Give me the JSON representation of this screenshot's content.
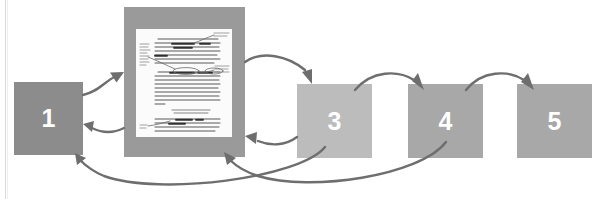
{
  "diagram": {
    "type": "process-flow-with-feedback-loops",
    "background_color": "#ffffff",
    "arrow_color": "#6e6e6e",
    "stages": [
      {
        "id": "stage-1",
        "label": "1",
        "kind": "box",
        "color": "#8c8c8c",
        "label_color": "#ffffff",
        "x": 14,
        "y": 82,
        "width": 69,
        "height": 73
      },
      {
        "id": "stage-2",
        "label": "",
        "kind": "document",
        "color": "#9a9a9a",
        "page_color": "#fbfbfb",
        "x": 124,
        "y": 7,
        "width": 121,
        "height": 150
      },
      {
        "id": "stage-3",
        "label": "3",
        "kind": "box",
        "color": "#bcbcbc",
        "label_color": "#ffffff",
        "x": 297,
        "y": 84,
        "width": 75,
        "height": 74
      },
      {
        "id": "stage-4",
        "label": "4",
        "kind": "box",
        "color": "#a8a8a8",
        "label_color": "#ffffff",
        "x": 408,
        "y": 84,
        "width": 75,
        "height": 74
      },
      {
        "id": "stage-5",
        "label": "5",
        "kind": "box",
        "color": "#a8a8a8",
        "label_color": "#ffffff",
        "x": 517,
        "y": 84,
        "width": 75,
        "height": 74
      }
    ],
    "connections": [
      {
        "id": "conn-1-to-2",
        "from": "stage-1",
        "to": "stage-2",
        "style": "curved-arrow",
        "direction": "forward"
      },
      {
        "id": "conn-2-to-1",
        "from": "stage-2",
        "to": "stage-1",
        "style": "curved-arrow",
        "direction": "feedback"
      },
      {
        "id": "conn-2-to-3",
        "from": "stage-2",
        "to": "stage-3",
        "style": "curved-arrow",
        "direction": "forward"
      },
      {
        "id": "conn-3-to-2",
        "from": "stage-3",
        "to": "stage-2",
        "style": "curved-arrow",
        "direction": "feedback"
      },
      {
        "id": "conn-3-to-4",
        "from": "stage-3",
        "to": "stage-4",
        "style": "curved-arrow",
        "direction": "forward"
      },
      {
        "id": "conn-4-to-5",
        "from": "stage-4",
        "to": "stage-5",
        "style": "curved-arrow",
        "direction": "forward"
      },
      {
        "id": "conn-3-to-1",
        "from": "stage-3",
        "to": "stage-1",
        "style": "long-curved-arrow",
        "direction": "feedback"
      },
      {
        "id": "conn-4-to-2",
        "from": "stage-4",
        "to": "stage-2",
        "style": "long-curved-arrow",
        "direction": "feedback"
      }
    ],
    "document_page": {
      "description": "marked-up manuscript page with margin annotations and highlighted passages",
      "text_color": "#5a5a5a",
      "highlight_color": "#3c3c3c"
    }
  }
}
